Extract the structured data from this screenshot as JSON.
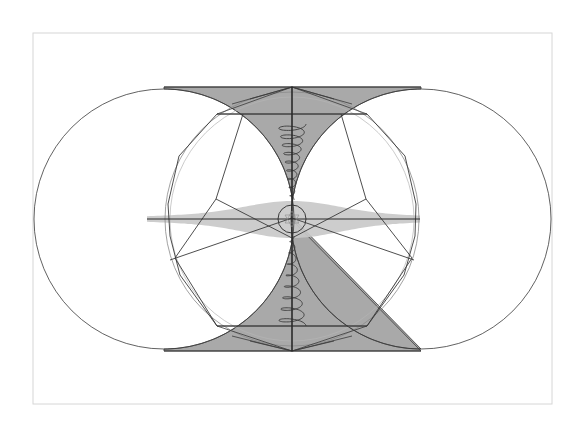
{
  "diagram": {
    "title": "",
    "frame": {
      "x": 33,
      "y": 33,
      "width": 519,
      "height": 371,
      "stroke": "#d6d6d6"
    },
    "colors": {
      "line": "#3a3a3a",
      "thin_line": "#8a8a8a",
      "hourglass_fill": "#a9a9a9",
      "lens_fill": "#c8c8c8",
      "axis": "#2a2a2a"
    },
    "axis": {
      "x": 292,
      "y": 219,
      "top": 87,
      "bottom": 351,
      "left": 147,
      "right": 420
    },
    "circles": [
      {
        "name": "left-circle",
        "cx": 164,
        "cy": 219,
        "r": 130
      },
      {
        "name": "right-circle",
        "cx": 421,
        "cy": 219,
        "r": 130
      },
      {
        "name": "middle-circle",
        "cx": 292,
        "cy": 219,
        "r": 127
      },
      {
        "name": "center-circle",
        "cx": 292,
        "cy": 219,
        "r": 14
      }
    ],
    "spirals": [
      {
        "name": "upper-spiral",
        "x": 292,
        "y_start": 124,
        "y_end": 200,
        "turns": 9,
        "max_rx": 20
      },
      {
        "name": "lower-spiral",
        "x": 292,
        "y_start": 236,
        "y_end": 326,
        "turns": 8,
        "max_rx": 20
      }
    ]
  }
}
